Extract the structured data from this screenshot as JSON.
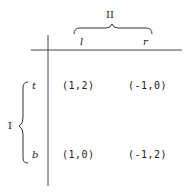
{
  "game": {
    "column_player": {
      "label": "II",
      "strategies": [
        "l",
        "r"
      ]
    },
    "row_player": {
      "label": "I",
      "strategies": [
        "t",
        "b"
      ]
    },
    "payoffs": [
      [
        "(1,2)",
        "(-1,0)"
      ],
      [
        "(1,0)",
        "(-1,2)"
      ]
    ]
  },
  "colors": {
    "ink": "#222222",
    "background": "#ffffff"
  }
}
